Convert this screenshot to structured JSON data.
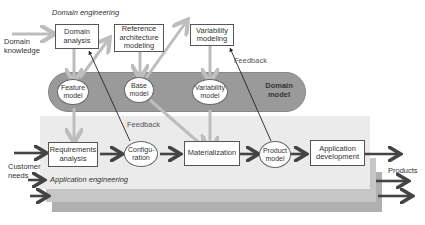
{
  "diagram": {
    "domain_engineering_label": "Domain engineering",
    "application_engineering_label": "Application engineering",
    "inputs": {
      "domain_knowledge": "Domain knowledge",
      "customer_needs": "Customer needs"
    },
    "outputs": {
      "products": "Products"
    },
    "feedback_labels": [
      "Feedback",
      "Feedback"
    ],
    "domain_processes": [
      {
        "id": "domain-analysis",
        "label": "Domain analysis"
      },
      {
        "id": "reference-architecture-modeling",
        "label": "Reference architecture modeling"
      },
      {
        "id": "variability-modeling",
        "label": "Variability modeling"
      }
    ],
    "domain_model": {
      "label": "Domain model",
      "artifacts": [
        {
          "id": "feature-model",
          "label": "Feature model"
        },
        {
          "id": "base-model",
          "label": "Base model"
        },
        {
          "id": "variability-model",
          "label": "Variability model"
        }
      ]
    },
    "application_steps": [
      {
        "id": "requirements-analysis",
        "label": "Requirements analysis",
        "shape": "box"
      },
      {
        "id": "configuration",
        "label": "Configu- ration",
        "shape": "ellipse"
      },
      {
        "id": "materialization",
        "label": "Materialization",
        "shape": "box"
      },
      {
        "id": "product-model",
        "label": "Product model",
        "shape": "ellipse"
      },
      {
        "id": "application-development",
        "label": "Application development",
        "shape": "box"
      }
    ],
    "colors": {
      "domain_band": "#999999",
      "app_layer_front": "#ebebeb",
      "app_layer_mid": "#c4c4c4",
      "app_layer_back": "#b0b0b0",
      "light_arrow": "#bdbdbd",
      "dark_arrow": "#444444"
    }
  }
}
